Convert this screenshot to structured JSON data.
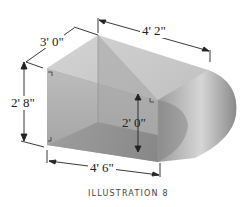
{
  "illustration": {
    "caption": "Illustration 8",
    "caption_display": "ILLUSTRATION 8",
    "dimensions": {
      "depth_top": "3' 0\"",
      "length_top": "4' 2\"",
      "height_left": "2' 8\"",
      "height_inner": "2' 0\"",
      "length_bottom": "4' 6\""
    },
    "colors": {
      "top_face": "#c9c9c9",
      "front_face": "#b4b4b4",
      "bottom_face": "#8e8e8e",
      "curve_light": "#d8d8d8",
      "curve_dark": "#8a8a8a",
      "line": "#222222"
    }
  }
}
